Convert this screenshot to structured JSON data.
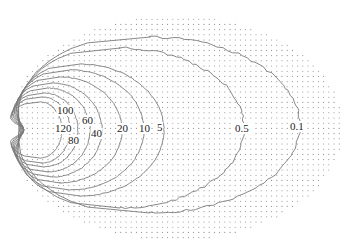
{
  "chart_data": {
    "type": "contour",
    "title": "",
    "xlabel": "",
    "ylabel": "",
    "grid": "dot-lattice",
    "legend": null,
    "contour_levels": [
      120,
      100,
      80,
      60,
      40,
      20,
      10,
      5,
      0.5,
      0.1
    ],
    "labels": [
      {
        "text": "100",
        "x": 57,
        "y": 114
      },
      {
        "text": "60",
        "x": 82,
        "y": 124
      },
      {
        "text": "120",
        "x": 55,
        "y": 132
      },
      {
        "text": "80",
        "x": 68,
        "y": 144
      },
      {
        "text": "40",
        "x": 91,
        "y": 137
      },
      {
        "text": "20",
        "x": 117,
        "y": 132
      },
      {
        "text": "10",
        "x": 139,
        "y": 132
      },
      {
        "text": "5",
        "x": 157,
        "y": 131
      },
      {
        "text": "0.5",
        "x": 235,
        "y": 132
      },
      {
        "text": "0.1",
        "x": 290,
        "y": 130
      }
    ],
    "contours": [
      {
        "level": 120,
        "cx": 40,
        "cy": 130,
        "rx": 22,
        "ry": 28,
        "notch": 20
      },
      {
        "level": 100,
        "cx": 42,
        "cy": 130,
        "rx": 28,
        "ry": 33,
        "notch": 19
      },
      {
        "level": 80,
        "cx": 44,
        "cy": 130,
        "rx": 34,
        "ry": 37,
        "notch": 18
      },
      {
        "level": 60,
        "cx": 48,
        "cy": 130,
        "rx": 42,
        "ry": 42,
        "notch": 17
      },
      {
        "level": 40,
        "cx": 52,
        "cy": 130,
        "rx": 50,
        "ry": 47,
        "notch": 16
      },
      {
        "level": 20,
        "cx": 60,
        "cy": 130,
        "rx": 62,
        "ry": 53,
        "notch": 14
      },
      {
        "level": 10,
        "cx": 70,
        "cy": 130,
        "rx": 74,
        "ry": 60,
        "notch": 12
      },
      {
        "level": 5,
        "cx": 80,
        "cy": 130,
        "rx": 84,
        "ry": 66,
        "notch": 10
      },
      {
        "level": 0.5,
        "cx": 120,
        "cy": 128,
        "rx": 124,
        "ry": 80,
        "notch": 8
      },
      {
        "level": 0.1,
        "cx": 150,
        "cy": 125,
        "rx": 150,
        "ry": 88,
        "notch": 6
      }
    ],
    "dot_field": {
      "cx": 175,
      "cy": 128,
      "rx": 168,
      "ry": 112,
      "spacing": 5.2,
      "left_cut": 22
    },
    "colors": {
      "contour": "#7a7a7a",
      "dots": "#8a8a8a",
      "labels": "#222222",
      "background": "#ffffff"
    }
  }
}
